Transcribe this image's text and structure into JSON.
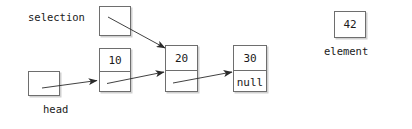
{
  "diagram": {
    "background_color": "#ffffff",
    "stroke_color": "#6e6e6e",
    "arrow_color": "#2b2b2b",
    "text_color": "#1a1a1a",
    "labels": {
      "selection": "selection",
      "head": "head",
      "element": "element"
    },
    "selection_box": {
      "name": "selection-pointer-box",
      "value": ""
    },
    "head_box": {
      "name": "head-pointer-box",
      "value": ""
    },
    "element_box": {
      "name": "element-value-box",
      "value": "42"
    },
    "nodes": [
      {
        "name": "node-10",
        "value": "10",
        "next": ""
      },
      {
        "name": "node-20",
        "value": "20",
        "next": ""
      },
      {
        "name": "node-30",
        "value": "30",
        "next": "null"
      }
    ],
    "arrows": [
      {
        "name": "arrow-head-to-node-10",
        "from": "head",
        "to": "node-10"
      },
      {
        "name": "arrow-selection-to-node-20",
        "from": "selection",
        "to": "node-20"
      },
      {
        "name": "arrow-node-10-to-node-20",
        "from": "node-10",
        "to": "node-20"
      },
      {
        "name": "arrow-node-20-to-node-30",
        "from": "node-20",
        "to": "node-30"
      }
    ]
  }
}
